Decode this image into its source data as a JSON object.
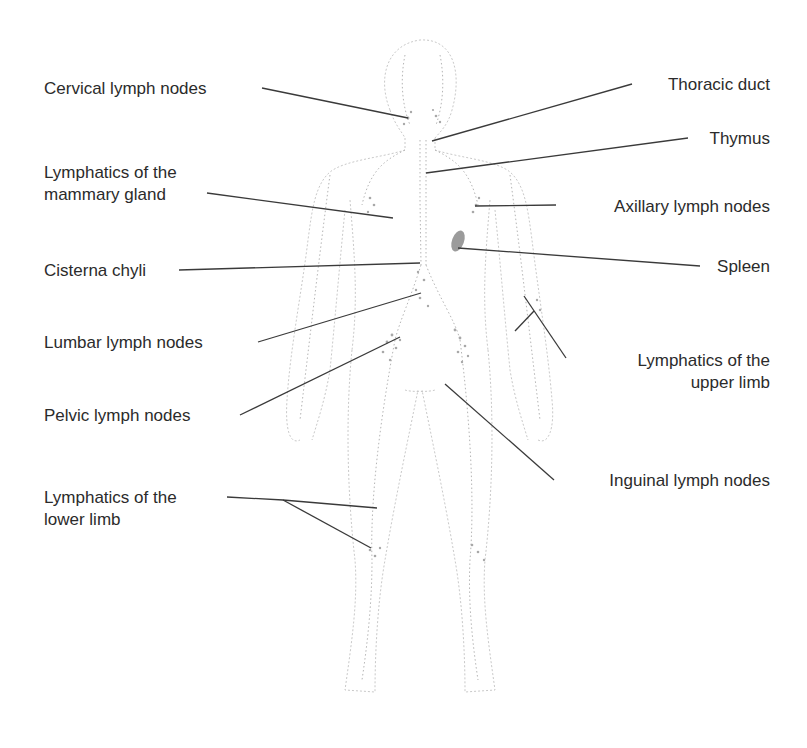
{
  "diagram": {
    "colors": {
      "label_text": "#2b2b2b",
      "leader_line": "#3a3a3a",
      "body_outline": "#c9c9c9",
      "spleen": "#8a8a8a",
      "background": "#ffffff"
    },
    "labels_left": [
      {
        "id": "cervical",
        "text": "Cervical lymph nodes"
      },
      {
        "id": "mammary",
        "line1": "Lymphatics of the",
        "line2": "mammary gland"
      },
      {
        "id": "cisterna",
        "text": "Cisterna chyli"
      },
      {
        "id": "lumbar",
        "text": "Lumbar lymph nodes"
      },
      {
        "id": "pelvic",
        "text": "Pelvic lymph nodes"
      },
      {
        "id": "lower_limb",
        "line1": "Lymphatics of the",
        "line2": "lower limb"
      }
    ],
    "labels_right": [
      {
        "id": "thoracic",
        "text": "Thoracic duct"
      },
      {
        "id": "thymus",
        "text": "Thymus"
      },
      {
        "id": "axillary",
        "text": "Axillary lymph nodes"
      },
      {
        "id": "spleen",
        "text": "Spleen"
      },
      {
        "id": "upper_limb",
        "line1": "Lymphatics of the",
        "line2": "upper limb"
      },
      {
        "id": "inguinal",
        "text": "Inguinal lymph nodes"
      }
    ]
  }
}
